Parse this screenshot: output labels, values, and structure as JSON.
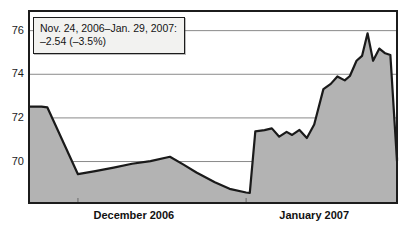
{
  "annotation": {
    "line1": "Nov. 24, 2006–Jan. 29, 2007:",
    "line2": "–2.54 (–3.5%)"
  },
  "chart_data": {
    "type": "area",
    "title": "",
    "subtitle": "",
    "xlabel": "",
    "ylabel": "",
    "grid": true,
    "legend": "none",
    "ylim": [
      68.1,
      76.9
    ],
    "yticks": [
      70,
      72,
      74,
      76
    ],
    "ytick_labels": [
      "70",
      "72",
      "74",
      "76"
    ],
    "xtick_labels": [
      "December 2006",
      "January 2007"
    ],
    "xtick_label_positions": [
      0.285,
      0.775
    ],
    "month_boundaries": [
      0.133,
      0.59
    ],
    "series": [
      {
        "name": "Index level",
        "color": "#1a1a1a",
        "fill": "#b3b3b3",
        "x": [
          0.0,
          0.034,
          0.05,
          0.133,
          0.18,
          0.23,
          0.28,
          0.33,
          0.383,
          0.42,
          0.455,
          0.505,
          0.545,
          0.59,
          0.6,
          0.615,
          0.64,
          0.66,
          0.68,
          0.7,
          0.715,
          0.735,
          0.755,
          0.775,
          0.8,
          0.82,
          0.838,
          0.858,
          0.872,
          0.89,
          0.905,
          0.92,
          0.935,
          0.952,
          0.968,
          0.982,
          1.0
        ],
        "y": [
          72.52,
          72.52,
          72.48,
          69.42,
          69.56,
          69.72,
          69.9,
          70.02,
          70.22,
          69.86,
          69.5,
          69.05,
          68.75,
          68.58,
          68.56,
          71.38,
          71.44,
          71.52,
          71.14,
          71.36,
          71.22,
          71.45,
          71.08,
          71.7,
          73.32,
          73.56,
          73.9,
          73.72,
          73.92,
          74.62,
          74.84,
          75.88,
          74.62,
          75.18,
          74.96,
          74.88,
          70.02
        ],
        "y_end": 70.18
      }
    ],
    "values_summary": {
      "start": 72.52,
      "min": 68.56,
      "max": 75.88,
      "end": 70.18
    }
  },
  "plot_frame": {
    "left": 29,
    "top": 11,
    "right": 397,
    "bottom": 203
  }
}
